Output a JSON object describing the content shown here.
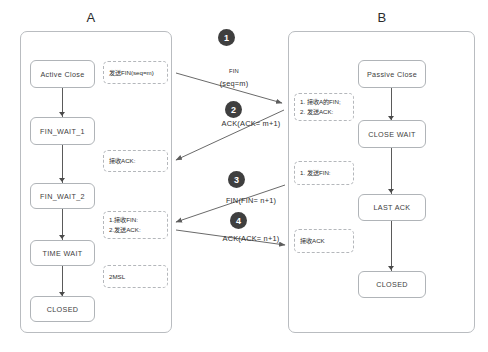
{
  "diagram": {
    "title_a": "A",
    "title_b": "B"
  },
  "host_a": {
    "states": [
      {
        "label": "Active Close"
      },
      {
        "label": "FIN_WAIT_1"
      },
      {
        "label": "FIN_WAIT_2"
      },
      {
        "label": "TIME WAIT"
      },
      {
        "label": "CLOSED"
      }
    ],
    "notes": [
      {
        "lines": [
          "发送FIN(seq=m)"
        ]
      },
      {
        "lines": [
          "接收ACK:"
        ]
      },
      {
        "lines": [
          "1.接收FIN:",
          "2.发送ACK:"
        ]
      },
      {
        "lines": [
          "2MSL"
        ]
      }
    ]
  },
  "host_b": {
    "states": [
      {
        "label": "Passive Close"
      },
      {
        "label": "CLOSE WAIT"
      },
      {
        "label": "LAST ACK"
      },
      {
        "label": "CLOSED"
      }
    ],
    "notes": [
      {
        "lines": [
          "1. 接收A的FIN;",
          "2. 发送ACK:"
        ]
      },
      {
        "lines": [
          "1. 发送FIN:"
        ]
      },
      {
        "lines": [
          "接收ACK"
        ]
      }
    ]
  },
  "messages": [
    {
      "step": "1",
      "line1": "FIN",
      "line2": "(seq=m)"
    },
    {
      "step": "2",
      "line1": "ACK(ACK= m+1)",
      "line2": ""
    },
    {
      "step": "3",
      "line1": "FIN(FIN= n+1)",
      "line2": ""
    },
    {
      "step": "4",
      "line1": "ACK(ACK= n+1)",
      "line2": ""
    }
  ],
  "colors": {
    "step_circle": "#3f3f3f",
    "panel_border": "#b9bcc0",
    "connector": "#5a5a5a"
  }
}
